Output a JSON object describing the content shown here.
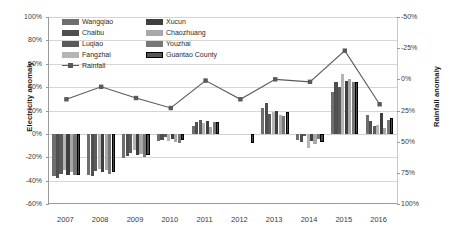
{
  "chart_data": {
    "type": "bar",
    "title": "",
    "xlabel": "",
    "ylabel": "Electricity anomaly",
    "y2label": "Rainfall anomaly",
    "categories": [
      "2007",
      "2008",
      "2009",
      "2010",
      "2011",
      "2012",
      "2013",
      "2014",
      "2015",
      "2016"
    ],
    "ylim": [
      -60,
      100
    ],
    "yticks": [
      "100%",
      "80%",
      "60%",
      "40%",
      "20%",
      "0%",
      "-20%",
      "-40%",
      "-60%"
    ],
    "y2lim": [
      100,
      -50
    ],
    "y2ticks": [
      "-50%",
      "-25%",
      "0%",
      "25%",
      "50%",
      "75%",
      "100%"
    ],
    "y2_inverted": true,
    "grid": true,
    "legend_position": "top-left-inside",
    "series": [
      {
        "name": "Wangqiao",
        "color": "#6e6e6e",
        "values": [
          -36,
          -35,
          -21,
          -6,
          7,
          null,
          22,
          -5,
          36,
          16
        ]
      },
      {
        "name": "Chaibu",
        "color": "#4f4f4f",
        "values": [
          -38,
          -36,
          -19,
          -5,
          10,
          null,
          26,
          -7,
          44,
          11
        ]
      },
      {
        "name": "Luqiao",
        "color": "#5a5a5a",
        "values": [
          -34,
          -32,
          -16,
          -3,
          12,
          null,
          17,
          -2,
          40,
          7
        ]
      },
      {
        "name": "Fangzhai",
        "color": "#b5b5b5",
        "values": [
          -31,
          -30,
          -14,
          -6,
          9,
          null,
          19,
          -12,
          51,
          8
        ]
      },
      {
        "name": "Xucun",
        "color": "#3f3f3f",
        "values": [
          -35,
          -33,
          -18,
          -4,
          11,
          null,
          20,
          -6,
          45,
          18
        ]
      },
      {
        "name": "Chaozhuang",
        "color": "#a8a8a8",
        "values": [
          -33,
          -31,
          -17,
          -7,
          6,
          null,
          16,
          -9,
          47,
          5
        ]
      },
      {
        "name": "Youzhai",
        "color": "#777777",
        "values": [
          -35,
          -34,
          -20,
          -8,
          10,
          null,
          15,
          -4,
          44,
          12
        ]
      },
      {
        "name": "Guantao County",
        "color": "#4a4a4a",
        "outline": true,
        "values": [
          -35,
          -33,
          -18,
          -5,
          10,
          -8,
          19,
          -7,
          44,
          14
        ]
      }
    ],
    "rainfall": {
      "name": "Rainfall",
      "color": "#595959",
      "marker": "square",
      "values": [
        16,
        6,
        15,
        23,
        1,
        16,
        0,
        2,
        -23,
        20
      ]
    }
  },
  "axes": {
    "left_title": "Electricity anomaly",
    "right_title": "Rainfall anomaly"
  }
}
